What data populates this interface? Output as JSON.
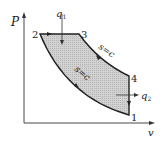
{
  "diagram": {
    "type": "P-v diagram",
    "axes": {
      "y_label": "P",
      "x_label": "v"
    },
    "points": [
      {
        "id": "1",
        "label": "1"
      },
      {
        "id": "2",
        "label": "2"
      },
      {
        "id": "3",
        "label": "3"
      },
      {
        "id": "4",
        "label": "4"
      }
    ],
    "processes": [
      {
        "from": "1",
        "to": "2",
        "label": "s=c"
      },
      {
        "from": "2",
        "to": "3",
        "label": ""
      },
      {
        "from": "3",
        "to": "4",
        "label": "s=c"
      },
      {
        "from": "4",
        "to": "1",
        "label": ""
      }
    ],
    "heat": {
      "in_label": "q",
      "in_sub": "1",
      "out_label": "q",
      "out_sub": "2"
    },
    "colors": {
      "fill": "#c8c8c8",
      "stroke": "#222222"
    }
  }
}
